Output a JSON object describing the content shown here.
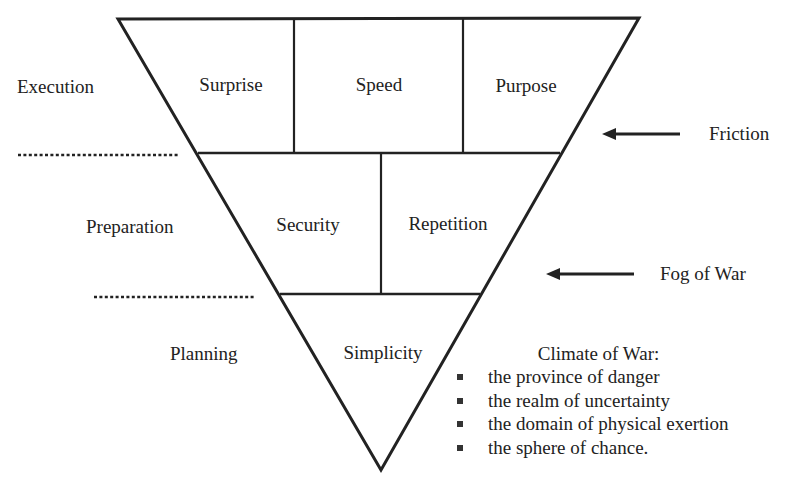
{
  "diagram": {
    "layers": [
      {
        "level": "Execution",
        "cells": [
          "Surprise",
          "Speed",
          "Purpose"
        ]
      },
      {
        "level": "Preparation",
        "cells": [
          "Security",
          "Repetition"
        ]
      },
      {
        "level": "Planning",
        "cells": [
          "Simplicity"
        ]
      }
    ],
    "forces": [
      {
        "label": "Friction",
        "arrow": "left-arrow"
      },
      {
        "label": "Fog of War",
        "arrow": "left-arrow"
      }
    ],
    "climate": {
      "title": "Climate of War:",
      "items": [
        "the province of danger",
        "the realm of uncertainty",
        "the domain of physical exertion",
        "the sphere of chance."
      ]
    },
    "colors": {
      "line": "#222222",
      "background": "#ffffff"
    }
  }
}
